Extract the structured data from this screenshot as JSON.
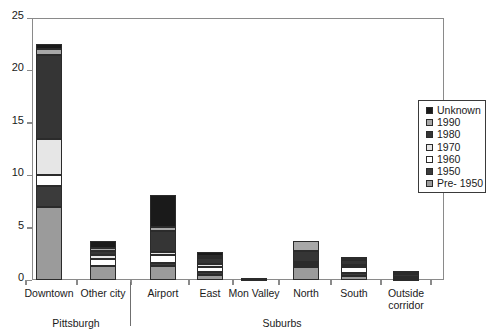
{
  "chart_data": {
    "type": "bar",
    "subtype": "stacked-bar",
    "title": "",
    "xlabel": "",
    "ylabel": "",
    "ylim": [
      0,
      25
    ],
    "yticks": [
      0,
      5,
      10,
      15,
      20,
      25
    ],
    "ytick_labels": [
      "0",
      "5",
      "10",
      "15",
      "20",
      "25"
    ],
    "grid": false,
    "legend_position": "right",
    "categories": [
      "Downtown",
      "Other city",
      "Airport",
      "East",
      "Mon Valley",
      "North",
      "South",
      "Outside corridor"
    ],
    "groups": [
      {
        "label": "Pittsburgh",
        "categories": [
          "Downtown",
          "Other city"
        ]
      },
      {
        "label": "Suburbs",
        "categories": [
          "Airport",
          "East",
          "Mon Valley",
          "North",
          "South",
          "Outside corridor"
        ]
      }
    ],
    "series": [
      {
        "name": "Pre- 1950",
        "color": "#9b9b9b",
        "values": [
          7.0,
          1.3,
          1.3,
          0.5,
          0.0,
          1.2,
          0.4,
          0.0
        ]
      },
      {
        "name": "1950",
        "color": "#3b3b3b",
        "values": [
          2.0,
          0.0,
          0.3,
          0.3,
          0.0,
          0.2,
          0.3,
          0.1
        ]
      },
      {
        "name": "1960",
        "color": "#ffffff",
        "values": [
          1.0,
          0.7,
          0.8,
          0.4,
          0.0,
          0.1,
          0.5,
          0.1
        ]
      },
      {
        "name": "1970",
        "color": "#e6e6e6",
        "values": [
          3.5,
          0.4,
          0.3,
          0.3,
          0.0,
          0.2,
          0.2,
          0.1
        ]
      },
      {
        "name": "1980",
        "color": "#353535",
        "values": [
          8.0,
          0.4,
          2.0,
          0.6,
          0.1,
          1.1,
          0.5,
          0.3
        ]
      },
      {
        "name": "1990",
        "color": "#a8a8a8",
        "values": [
          0.5,
          0.3,
          0.4,
          0.2,
          0.0,
          0.9,
          0.2,
          0.1
        ]
      },
      {
        "name": "Unknown",
        "color": "#1a1a1a",
        "values": [
          0.5,
          0.6,
          3.0,
          0.4,
          0.1,
          0.0,
          0.1,
          0.2
        ]
      }
    ],
    "totals": [
      22.5,
      3.7,
      8.1,
      2.7,
      0.2,
      3.7,
      2.2,
      0.9
    ],
    "legend_entries": [
      {
        "label": "Unknown",
        "color": "#1a1a1a"
      },
      {
        "label": "1990",
        "color": "#a8a8a8"
      },
      {
        "label": "1980",
        "color": "#353535"
      },
      {
        "label": "1970",
        "color": "#e6e6e6"
      },
      {
        "label": "1960",
        "color": "#ffffff"
      },
      {
        "label": "1950",
        "color": "#3b3b3b"
      },
      {
        "label": "Pre- 1950",
        "color": "#9b9b9b"
      }
    ]
  },
  "colors": {
    "axis": "#8a8a8a",
    "frame": "#8a8a8a",
    "text": "#1a1a1a",
    "legend_border": "#3a3a3a",
    "separator": "#6f6f6f",
    "segment_outline": "#2b2b2b",
    "background": "#ffffff"
  }
}
